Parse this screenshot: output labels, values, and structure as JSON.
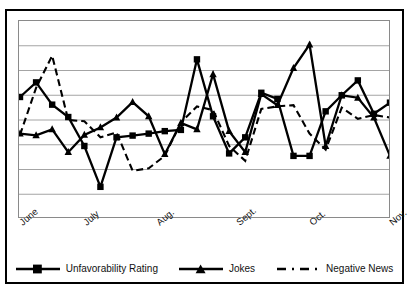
{
  "chart_data": {
    "type": "line",
    "title": "",
    "subtitle": "",
    "xlabel": "",
    "ylabel": "",
    "grid": true,
    "gridlines": 7,
    "ylim": [
      0,
      8
    ],
    "legend_position": "bottom",
    "x_tick_labels": [
      "June",
      "July",
      "Aug.",
      "Sept.",
      "Oct.",
      "Nov."
    ],
    "x_tick_positions": [
      0,
      4,
      8.5,
      13.5,
      18,
      23
    ],
    "x": [
      0,
      1,
      2,
      3,
      4,
      5,
      6,
      7,
      8,
      9,
      10,
      11,
      12,
      13,
      14,
      15,
      16,
      17,
      18,
      19,
      20,
      21,
      22,
      23
    ],
    "series": [
      {
        "name": "Unfavorability Rating",
        "style": "solid",
        "marker": "square",
        "color": "#000000",
        "values": [
          4.93,
          5.52,
          4.62,
          4.12,
          2.95,
          1.3,
          3.3,
          3.37,
          3.45,
          3.55,
          3.6,
          6.45,
          4.15,
          2.65,
          3.3,
          5.1,
          4.85,
          2.55,
          2.55,
          4.35,
          5.0,
          5.6,
          4.25,
          4.7
        ]
      },
      {
        "name": "Jokes",
        "style": "solid",
        "marker": "triangle",
        "color": "#000000",
        "values": [
          3.45,
          3.38,
          3.62,
          2.7,
          3.4,
          3.7,
          4.1,
          4.72,
          4.15,
          2.62,
          3.88,
          3.62,
          5.85,
          3.55,
          2.7,
          5.05,
          4.6,
          6.1,
          7.05,
          2.95,
          5.0,
          4.9,
          4.1,
          2.55
        ]
      },
      {
        "name": "Negative News",
        "style": "dashed",
        "marker": "none",
        "color": "#000000",
        "values": [
          3.4,
          5.3,
          6.6,
          4.0,
          3.95,
          3.3,
          3.5,
          1.95,
          2.05,
          2.55,
          3.9,
          4.55,
          4.4,
          2.95,
          2.35,
          4.45,
          4.55,
          4.6,
          3.45,
          2.8,
          4.5,
          4.05,
          4.2,
          4.1
        ]
      }
    ]
  },
  "legend": {
    "items": [
      {
        "label": "Unfavorability Rating",
        "marker": "square",
        "style": "solid"
      },
      {
        "label": "Jokes",
        "marker": "triangle",
        "style": "solid"
      },
      {
        "label": "Negative News",
        "marker": "none",
        "style": "dashed"
      }
    ]
  }
}
